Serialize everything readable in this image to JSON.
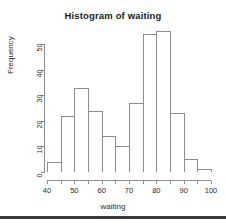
{
  "chart_data": {
    "type": "bar",
    "title": "Histogram of waiting",
    "xlabel": "waiting",
    "ylabel": "Frequency",
    "bin_width": 5,
    "bin_edges": [
      40,
      45,
      50,
      55,
      60,
      65,
      70,
      75,
      80,
      85,
      90,
      95,
      100
    ],
    "categories": [
      "40-45",
      "45-50",
      "50-55",
      "55-60",
      "60-65",
      "65-70",
      "70-75",
      "75-80",
      "80-85",
      "85-90",
      "90-95",
      "95-100"
    ],
    "values": [
      4,
      22,
      33,
      24,
      14,
      10,
      27,
      54,
      55,
      23,
      5,
      1
    ],
    "bin_starts": [
      40,
      45,
      50,
      55,
      60,
      65,
      70,
      75,
      80,
      85,
      90,
      95
    ],
    "xlim": [
      40,
      100
    ],
    "ylim": [
      0,
      55
    ],
    "x_ticks": [
      40,
      50,
      60,
      70,
      80,
      90,
      100
    ],
    "x_tick_labels": [
      "40",
      "50",
      "60",
      "70",
      "80",
      "90",
      "100"
    ],
    "y_ticks": [
      0,
      10,
      20,
      30,
      40,
      50
    ],
    "y_tick_labels": [
      "0",
      "10",
      "20",
      "30",
      "40",
      "50"
    ],
    "grid": false,
    "legend": "none",
    "bar_border_color": "#8d8d8d",
    "bar_fill_color": "#ffffff",
    "axis_color": "#8d8d8d",
    "text_color": "#2b2b2b",
    "title_color": "#1a1a1a",
    "background_color": "#ffffff"
  }
}
